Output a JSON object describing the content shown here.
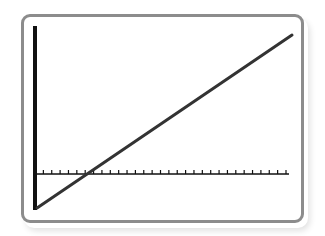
{
  "chart_data": {
    "type": "line",
    "title": "",
    "xlabel": "",
    "ylabel": "",
    "grid": false,
    "legend": null,
    "x_ticks_count": 30,
    "axes": {
      "y_axis_x_px": 35,
      "x_axis_y_px": 174,
      "x_start_px": 36,
      "x_end_px": 289,
      "y_top_px": 26,
      "y_bottom_px": 210
    },
    "series": [
      {
        "name": "line",
        "description": "straight line with positive slope, negative y-intercept, crossing x-axis near the 5th tick",
        "start_px": [
          37,
          208
        ],
        "end_px": [
          292,
          35
        ],
        "x_intercept_tick": 5.4
      }
    ]
  },
  "colors": {
    "frame": "#8c8c8c",
    "axis": "#111111",
    "line": "#333333",
    "background": "#ffffff"
  }
}
